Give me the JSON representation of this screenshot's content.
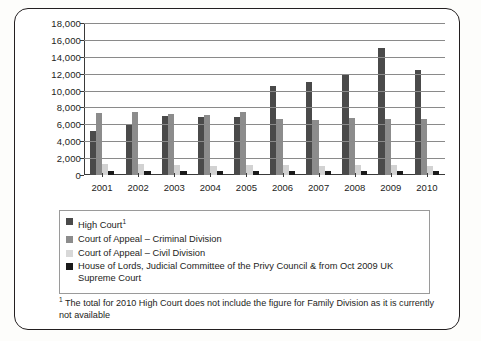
{
  "chart_data": {
    "type": "bar",
    "title": "",
    "xlabel": "",
    "ylabel": "",
    "ylim": [
      0,
      18000
    ],
    "ytick_step": 2000,
    "ytick_labels": [
      "18,000",
      "16,000",
      "14,000",
      "12,000",
      "10,000",
      "8,000",
      "6,000",
      "4,000",
      "2,000",
      "0"
    ],
    "ytick_values": [
      18000,
      16000,
      14000,
      12000,
      10000,
      8000,
      6000,
      4000,
      2000,
      0
    ],
    "grid": "horizontal",
    "legend_position": "below-plot",
    "categories": [
      "2001",
      "2002",
      "2003",
      "2004",
      "2005",
      "2006",
      "2007",
      "2008",
      "2009",
      "2010"
    ],
    "series": [
      {
        "name": "High Court",
        "color": "#4a4a4a",
        "values": [
          5200,
          6000,
          7000,
          6900,
          6900,
          10500,
          11000,
          11800,
          15000,
          12400
        ]
      },
      {
        "name": "Court of Appeal – Criminal Division",
        "color": "#8c8c8c",
        "values": [
          7300,
          7500,
          7200,
          7100,
          7500,
          6600,
          6500,
          6700,
          6600,
          6600
        ]
      },
      {
        "name": "Court of Appeal – Civil Division",
        "color": "#d2d2d2",
        "values": [
          1300,
          1250,
          1200,
          1100,
          1150,
          1150,
          1100,
          1150,
          1200,
          1100
        ]
      },
      {
        "name": "House of Lords, Judicial Committee of the Privy Council & from Oct 2009 UK Supreme Court",
        "color": "#1a1a1a",
        "values": [
          500,
          520,
          480,
          450,
          470,
          420,
          430,
          440,
          450,
          420
        ]
      }
    ]
  },
  "legend": {
    "items": [
      {
        "label": "High Court",
        "footnote_marker": "1",
        "swatch": "#4a4a4a"
      },
      {
        "label": "Court of Appeal – Criminal Division",
        "footnote_marker": "",
        "swatch": "#8c8c8c"
      },
      {
        "label": "Court of Appeal – Civil Division",
        "footnote_marker": "",
        "swatch": "#d8d8d8"
      },
      {
        "label": "House of Lords, Judicial  Committee of the Privy Council & from Oct 2009 UK Supreme Court",
        "footnote_marker": "",
        "swatch": "#1a1a1a"
      }
    ]
  },
  "footnote": {
    "marker": "1",
    "text": "The total for 2010 High Court does not include the figure for Family Division as it is currently not available"
  }
}
